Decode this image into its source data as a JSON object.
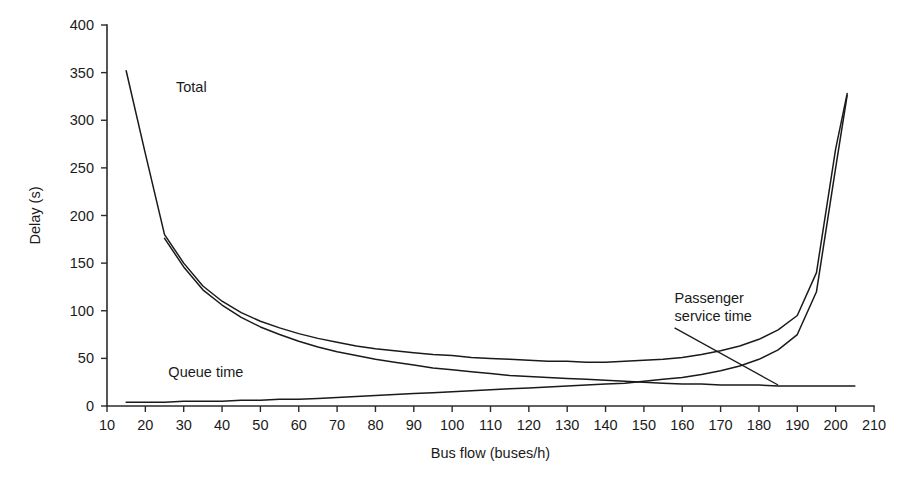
{
  "chart_data": {
    "type": "line",
    "title": "",
    "xlabel": "Bus flow (buses/h)",
    "ylabel": "Delay (s)",
    "xlim": [
      10,
      210
    ],
    "ylim": [
      0,
      400
    ],
    "xticks": [
      10,
      20,
      30,
      40,
      50,
      60,
      70,
      80,
      90,
      100,
      110,
      120,
      130,
      140,
      150,
      160,
      170,
      180,
      190,
      200,
      210
    ],
    "yticks": [
      0,
      50,
      100,
      150,
      200,
      250,
      300,
      350,
      400
    ],
    "grid": false,
    "legend_position": "inline-annotations",
    "annotations": [
      {
        "name": "total-label",
        "text": "Total",
        "x": 28,
        "y": 330,
        "leader": false
      },
      {
        "name": "queue-time-label",
        "text": "Queue time",
        "x": 26,
        "y": 30,
        "leader": false
      },
      {
        "name": "passenger-service-time-label",
        "text": "Passenger",
        "text2": "service time",
        "x": 158,
        "y": 108,
        "leader": true,
        "leader_from_x": 158,
        "leader_from_y": 82,
        "leader_to_x": 185,
        "leader_to_y": 22
      }
    ],
    "series": [
      {
        "name": "Total",
        "x": [
          15,
          20,
          25,
          30,
          35,
          40,
          45,
          50,
          55,
          60,
          65,
          70,
          75,
          80,
          85,
          90,
          95,
          100,
          105,
          110,
          115,
          120,
          125,
          130,
          135,
          140,
          145,
          150,
          155,
          160,
          165,
          170,
          175,
          180,
          185,
          190,
          195,
          200,
          203
        ],
        "values": [
          352,
          265,
          180,
          150,
          126,
          110,
          98,
          89,
          82,
          76,
          71,
          67,
          63,
          60,
          58,
          56,
          54,
          53,
          51,
          50,
          49,
          48,
          47,
          47,
          46,
          46,
          47,
          48,
          49,
          51,
          54,
          58,
          63,
          70,
          80,
          95,
          140,
          270,
          328
        ]
      },
      {
        "name": "Passenger service time",
        "x": [
          25,
          30,
          35,
          40,
          45,
          50,
          55,
          60,
          65,
          70,
          75,
          80,
          85,
          90,
          95,
          100,
          105,
          110,
          115,
          120,
          125,
          130,
          135,
          140,
          145,
          150,
          155,
          160,
          165,
          170,
          175,
          180,
          185,
          190,
          195,
          200,
          205
        ],
        "values": [
          176,
          146,
          122,
          106,
          93,
          83,
          75,
          68,
          62,
          57,
          53,
          49,
          46,
          43,
          40,
          38,
          36,
          34,
          32,
          31,
          30,
          29,
          28,
          27,
          26,
          25,
          24,
          23,
          23,
          22,
          22,
          22,
          21,
          21,
          21,
          21,
          21
        ]
      },
      {
        "name": "Queue time",
        "x": [
          15,
          20,
          25,
          30,
          35,
          40,
          45,
          50,
          55,
          60,
          65,
          70,
          75,
          80,
          85,
          90,
          95,
          100,
          105,
          110,
          115,
          120,
          125,
          130,
          135,
          140,
          145,
          150,
          155,
          160,
          165,
          170,
          175,
          180,
          185,
          190,
          195,
          200,
          203
        ],
        "values": [
          4,
          4,
          4,
          5,
          5,
          5,
          6,
          6,
          7,
          7,
          8,
          9,
          10,
          11,
          12,
          13,
          14,
          15,
          16,
          17,
          18,
          19,
          20,
          21,
          22,
          23,
          24,
          26,
          28,
          30,
          33,
          37,
          42,
          49,
          59,
          75,
          120,
          250,
          326
        ]
      }
    ]
  }
}
